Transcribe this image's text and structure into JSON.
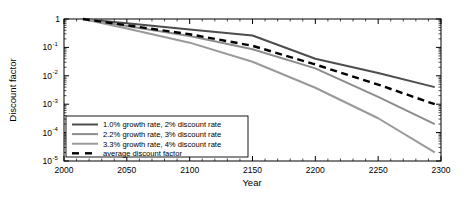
{
  "chart_data": {
    "type": "line",
    "title": "",
    "xlabel": "Year",
    "ylabel": "Discount factor",
    "xlim": [
      2000,
      2300
    ],
    "ylim": [
      1e-05,
      1
    ],
    "yscale": "log",
    "grid": false,
    "legend_position": "lower-left",
    "xticks": [
      2000,
      2050,
      2100,
      2150,
      2200,
      2250,
      2300
    ],
    "xtick_labels": [
      "2000",
      "2050",
      "2100",
      "2150",
      "2200",
      "2250",
      "2300"
    ],
    "yticks": [
      1,
      0.1,
      0.01,
      0.001,
      0.0001,
      1e-05
    ],
    "ytick_labels": [
      "1",
      "10",
      "10",
      "10",
      "10",
      "10"
    ],
    "ytick_exponents": [
      "",
      "-1",
      "-2",
      "-3",
      "-4",
      "-5"
    ],
    "x": [
      2015,
      2050,
      2100,
      2150,
      2200,
      2250,
      2295
    ],
    "series": [
      {
        "name": "1.0% growth rate, 2% discount rate",
        "label": "1.0% growth rate, 2% discount rate",
        "color": "#4d4d4d",
        "style": "solid",
        "width": 2.0,
        "values": [
          1.0,
          0.705,
          0.43,
          0.262,
          0.04,
          0.0126,
          0.004
        ],
        "endpoint": 0.004
      },
      {
        "name": "2.2% growth rate, 3% discount rate",
        "label": "2.2% growth rate, 3% discount rate",
        "color": "#8c8c8c",
        "style": "solid",
        "width": 2.0,
        "values": [
          1.0,
          0.57,
          0.254,
          0.086,
          0.0182,
          0.0018,
          0.0002
        ],
        "endpoint": 0.0002
      },
      {
        "name": "3.3% growth rate, 4% discount rate",
        "label": "3.3% growth rate, 4% discount rate",
        "color": "#999999",
        "style": "solid",
        "width": 2.0,
        "values": [
          1.0,
          0.465,
          0.147,
          0.0312,
          0.0038,
          0.00032,
          2e-05
        ],
        "endpoint": 2e-05
      },
      {
        "name": "average discount factor",
        "label": "average discount factor",
        "color": "#000000",
        "style": "dashed",
        "width": 2.4,
        "values": [
          1.0,
          0.6,
          0.29,
          0.114,
          0.025,
          0.0049,
          0.001
        ],
        "endpoint": 0.001
      }
    ]
  },
  "axes": {
    "xlabel": "Year",
    "ylabel": "Discount factor"
  }
}
